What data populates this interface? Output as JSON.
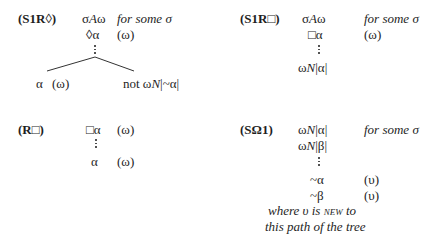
{
  "rules": [
    {
      "id": "S1R-diamond",
      "label": "(S1R◊)",
      "lines": [
        {
          "formula": "σAω",
          "annotation": "for some σ"
        },
        {
          "formula": "◊α",
          "annotation": "(ω)"
        }
      ],
      "branches": [
        {
          "formula": "α",
          "annotation": "(ω)"
        },
        {
          "formula": "not ωN|~α|"
        }
      ]
    },
    {
      "id": "S1R-box",
      "label": "(S1R□)",
      "lines": [
        {
          "formula": "σAω",
          "annotation": "for some σ"
        },
        {
          "formula": "□α",
          "annotation": "(ω)"
        },
        {
          "formula": "ωN|α|"
        }
      ]
    },
    {
      "id": "R-box",
      "label": "(R□)",
      "lines": [
        {
          "formula": "□α",
          "annotation": "(ω)"
        },
        {
          "formula": "α",
          "annotation": "(ω)"
        }
      ]
    },
    {
      "id": "S-omega-1",
      "label": "(SΩ1)",
      "lines": [
        {
          "formula": "ωN|α|",
          "annotation": "for some σ"
        },
        {
          "formula": "ωN|β|"
        },
        {
          "formula": "~α",
          "annotation": "(υ)"
        },
        {
          "formula": "~β",
          "annotation": "(υ)"
        }
      ],
      "note": {
        "line1_a": "where υ is ",
        "line1_sc": "new",
        "line1_b": " to",
        "line2": "this path of the tree"
      }
    }
  ]
}
